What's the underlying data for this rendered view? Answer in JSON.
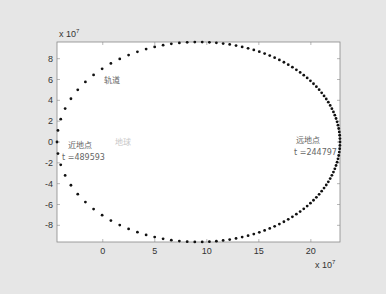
{
  "chart_data": {
    "type": "scatter",
    "title": "",
    "xlabel": "",
    "ylabel": "",
    "x_exponent_label": "x 10^7",
    "y_exponent_label": "x 10^7",
    "xlim": [
      -4.4,
      22.8
    ],
    "ylim": [
      -9.6,
      9.6
    ],
    "xticks": [
      0,
      5,
      10,
      15,
      20
    ],
    "yticks": [
      -8,
      -6,
      -4,
      -2,
      0,
      2,
      4,
      6,
      8
    ],
    "grid": false,
    "series": [
      {
        "name": "轨道",
        "shape": "ellipse",
        "center_x": 9.2,
        "center_y": 0,
        "semi_major_x": 13.6,
        "semi_minor_y": 9.6,
        "marker": "dot",
        "color": "#111111",
        "point_count": 120
      }
    ],
    "annotations": [
      {
        "text": "轨道",
        "x": 0.5,
        "y": 5.6
      },
      {
        "text": "近地点",
        "x": -3.4,
        "y": -0.4
      },
      {
        "text": "t =489593",
        "x": -3.9,
        "y": -1.6
      },
      {
        "text": "地球",
        "x": 1.2,
        "y": -0.2
      },
      {
        "text": "远地点",
        "x": 18.5,
        "y": -0.2
      },
      {
        "text": "t =244797",
        "x": 18.3,
        "y": -1.4
      }
    ]
  },
  "labels": {
    "x_exp": "x 10",
    "y_exp": "x 10",
    "exp_power": "7",
    "orbit": "轨道",
    "perigee": "近地点",
    "perigee_time": "t =489593",
    "earth": "地球",
    "apogee": "远地点",
    "apogee_time": "t =244797"
  },
  "ticks": {
    "x": [
      "0",
      "5",
      "10",
      "15",
      "20"
    ],
    "y": [
      "8",
      "6",
      "4",
      "2",
      "0",
      "-2",
      "-4",
      "-6",
      "-8"
    ]
  }
}
